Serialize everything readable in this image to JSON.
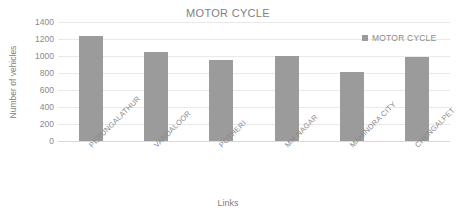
{
  "chart_data": {
    "type": "bar",
    "title": "MOTOR CYCLE",
    "xlabel": "Links",
    "ylabel": "Number of vehicles",
    "categories": [
      "PERUNGALATHUR",
      "VANDALOOR",
      "POTHERI",
      "MM NAGAR",
      "MAHINDRA CITY",
      "CHENGALPET"
    ],
    "values": [
      1230,
      1050,
      955,
      995,
      810,
      990
    ],
    "series": [
      {
        "name": "MOTOR CYCLE",
        "values": [
          1230,
          1050,
          955,
          995,
          810,
          990
        ],
        "color": "#9b9b9b"
      }
    ],
    "ylim": [
      0,
      1400
    ],
    "ytick_step": 200,
    "yticks": [
      1400,
      1200,
      1000,
      800,
      600,
      400,
      200,
      0
    ],
    "ytick_labels": [
      "1400",
      "1200",
      "1000",
      "800",
      "600",
      "400",
      "200",
      "0"
    ],
    "grid": true,
    "legend": {
      "position": "top-right",
      "entries": [
        "MOTOR CYCLE"
      ]
    },
    "colors": {
      "bar": "#9b9b9b",
      "gridline": "#e9e9e9",
      "text": "#8a8a8a",
      "background": "#ffffff"
    }
  }
}
